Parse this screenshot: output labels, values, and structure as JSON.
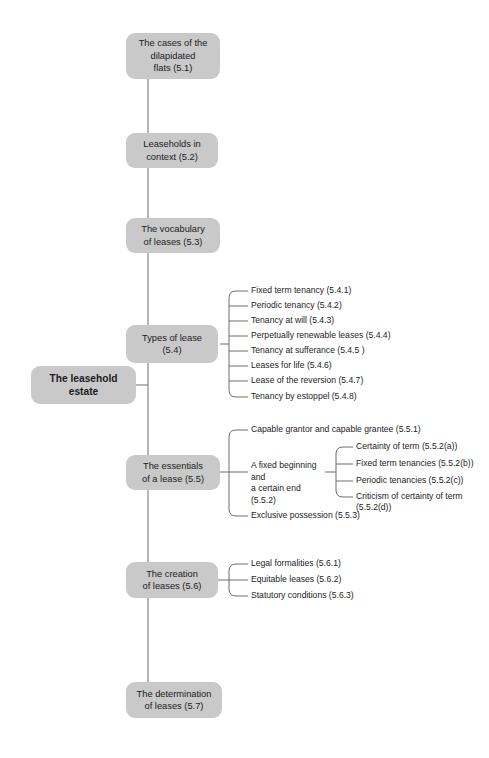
{
  "diagram": {
    "title": "The leasehold estate",
    "type": "mind-map",
    "theme": {
      "node_fill": "#c9c9c9",
      "node_text": "#1c1c1c",
      "connector": "#6d6d6d",
      "background": "#ffffff"
    },
    "root": {
      "label": "The leasehold\nestate"
    },
    "branches": [
      {
        "id": "5.1",
        "label": "The cases of the\ndilapidated\nflats (5.1)",
        "children": []
      },
      {
        "id": "5.2",
        "label": "Leaseholds in\ncontext (5.2)",
        "children": []
      },
      {
        "id": "5.3",
        "label": "The vocabulary\nof leases (5.3)",
        "children": []
      },
      {
        "id": "5.4",
        "label": "Types of lease\n(5.4)",
        "children": [
          {
            "id": "5.4.1",
            "label": "Fixed term tenancy (5.4.1)"
          },
          {
            "id": "5.4.2",
            "label": "Periodic tenancy (5.4.2)"
          },
          {
            "id": "5.4.3",
            "label": "Tenancy at will (5.4.3)"
          },
          {
            "id": "5.4.4",
            "label": "Perpetually renewable leases (5.4.4)"
          },
          {
            "id": "5.4.5",
            "label": "Tenancy at sufferance (5.4.5 )"
          },
          {
            "id": "5.4.6",
            "label": "Leases for life (5.4.6)"
          },
          {
            "id": "5.4.7",
            "label": "Lease of the reversion (5.4.7)"
          },
          {
            "id": "5.4.8",
            "label": "Tenancy by estoppel (5.4.8)"
          }
        ]
      },
      {
        "id": "5.5",
        "label": "The essentials\nof a lease (5.5)",
        "children": [
          {
            "id": "5.5.1",
            "label": "Capable grantor and capable grantee (5.5.1)"
          },
          {
            "id": "5.5.2",
            "label": "A fixed beginning and\na certain end (5.5.2)",
            "children": [
              {
                "id": "5.5.2a",
                "label": "Certainty of term (5.5.2(a))"
              },
              {
                "id": "5.5.2b",
                "label": "Fixed term tenancies (5.5.2(b))"
              },
              {
                "id": "5.5.2c",
                "label": "Periodic tenancies (5.5.2(c))"
              },
              {
                "id": "5.5.2d",
                "label": "Criticism of certainty of term (5.5.2(d))"
              }
            ]
          },
          {
            "id": "5.5.3",
            "label": "Exclusive possession (5.5.3)"
          }
        ]
      },
      {
        "id": "5.6",
        "label": "The creation\nof leases (5.6)",
        "children": [
          {
            "id": "5.6.1",
            "label": "Legal formalities (5.6.1)"
          },
          {
            "id": "5.6.2",
            "label": "Equitable leases (5.6.2)"
          },
          {
            "id": "5.6.3",
            "label": "Statutory conditions (5.6.3)"
          }
        ]
      },
      {
        "id": "5.7",
        "label": "The determination\nof leases (5.7)",
        "children": []
      }
    ]
  }
}
